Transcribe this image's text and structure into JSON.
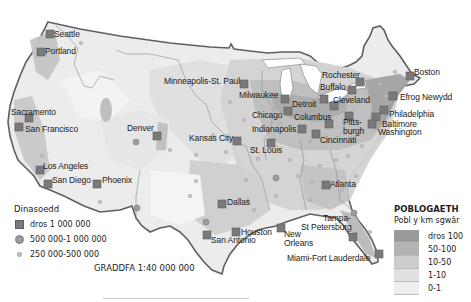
{
  "map": {
    "subject": "Population density of the contiguous United States",
    "colors": {
      "water": "#ffffff",
      "border": "#5f5f5f",
      "state_lines": "#8c8c8c",
      "city_large": "#7a7a7a",
      "city_medium": "#9c9c9c",
      "city_small": "#c8c8c8"
    },
    "cities": [
      {
        "name": "Seattle",
        "size": "large",
        "x": 50,
        "y": 34
      },
      {
        "name": "Portland",
        "size": "large",
        "x": 41,
        "y": 52
      },
      {
        "name": "Sacramento",
        "size": "large",
        "x": 28,
        "y": 118
      },
      {
        "name": "San Francisco",
        "size": "large",
        "x": 19,
        "y": 127
      },
      {
        "name": "Los Angeles",
        "size": "large",
        "x": 40,
        "y": 170
      },
      {
        "name": "San Diego",
        "size": "large",
        "x": 48,
        "y": 184
      },
      {
        "name": "Phoenix",
        "size": "large",
        "x": 97,
        "y": 184
      },
      {
        "name": "Denver",
        "size": "large",
        "x": 157,
        "y": 136
      },
      {
        "name": "Minneapolis-St. Paul",
        "size": "large",
        "x": 244,
        "y": 84
      },
      {
        "name": "Milwaukee",
        "size": "large",
        "x": 284,
        "y": 99
      },
      {
        "name": "Chicago",
        "size": "large",
        "x": 287,
        "y": 111
      },
      {
        "name": "Detroit",
        "size": "large",
        "x": 321,
        "y": 99
      },
      {
        "name": "Columbus",
        "size": "large",
        "x": 329,
        "y": 124
      },
      {
        "name": "Indianapolis",
        "size": "large",
        "x": 302,
        "y": 129
      },
      {
        "name": "Cincinnati",
        "size": "large",
        "x": 316,
        "y": 134
      },
      {
        "name": "Kansas City",
        "size": "large",
        "x": 237,
        "y": 141
      },
      {
        "name": "St. Louis",
        "size": "large",
        "x": 271,
        "y": 143
      },
      {
        "name": "Rochester",
        "size": "large",
        "x": 360,
        "y": 82
      },
      {
        "name": "Buffalo",
        "size": "large",
        "x": 352,
        "y": 90
      },
      {
        "name": "Cleveland",
        "size": "large",
        "x": 334,
        "y": 106
      },
      {
        "name": "Pittsburgh",
        "size": "large",
        "x": 349,
        "y": 116
      },
      {
        "name": "Boston",
        "size": "large",
        "x": 410,
        "y": 76
      },
      {
        "name": "Efrog Newydd",
        "size": "large",
        "x": 393,
        "y": 96
      },
      {
        "name": "Philadelphia",
        "size": "large",
        "x": 384,
        "y": 110
      },
      {
        "name": "Baltimore",
        "size": "large",
        "x": 376,
        "y": 117
      },
      {
        "name": "Washington",
        "size": "large",
        "x": 372,
        "y": 124
      },
      {
        "name": "Atlanta",
        "size": "large",
        "x": 326,
        "y": 185
      },
      {
        "name": "Dallas",
        "size": "large",
        "x": 222,
        "y": 204
      },
      {
        "name": "Houston",
        "size": "large",
        "x": 236,
        "y": 232
      },
      {
        "name": "San Antonio",
        "size": "large",
        "x": 207,
        "y": 235
      },
      {
        "name": "New Orleans",
        "size": "large",
        "x": 281,
        "y": 228
      },
      {
        "name": "Tampa-St Petersburg",
        "size": "large",
        "x": 353,
        "y": 237
      },
      {
        "name": "Miami-Fort Lauderdale",
        "size": "large",
        "x": 376,
        "y": 254
      }
    ]
  },
  "labels": [
    {
      "text": "Seattle",
      "x": 54,
      "y": 30
    },
    {
      "text": "Portland",
      "x": 45,
      "y": 47
    },
    {
      "text": "Sacramento",
      "x": 11,
      "y": 108
    },
    {
      "text": "San Francisco",
      "x": 25,
      "y": 125
    },
    {
      "text": "Los Angeles",
      "x": 43,
      "y": 162
    },
    {
      "text": "San Diego",
      "x": 52,
      "y": 176
    },
    {
      "text": "Phoenix",
      "x": 102,
      "y": 176
    },
    {
      "text": "Denver",
      "x": 127,
      "y": 124
    },
    {
      "text": "Minneapolis-St. Paul",
      "x": 164,
      "y": 77
    },
    {
      "text": "Milwaukee",
      "x": 239,
      "y": 91
    },
    {
      "text": "Chicago",
      "x": 252,
      "y": 111
    },
    {
      "text": "Detroit",
      "x": 292,
      "y": 100
    },
    {
      "text": "Columbus",
      "x": 294,
      "y": 113
    },
    {
      "text": "Indianapolis",
      "x": 252,
      "y": 125
    },
    {
      "text": "Cincinnati",
      "x": 320,
      "y": 136
    },
    {
      "text": "Kansas City",
      "x": 189,
      "y": 134
    },
    {
      "text": "St. Louis",
      "x": 250,
      "y": 146
    },
    {
      "text": "Rochester",
      "x": 322,
      "y": 71
    },
    {
      "text": "Buffalo",
      "x": 320,
      "y": 83
    },
    {
      "text": "Cleveland",
      "x": 333,
      "y": 96
    },
    {
      "text": "Pitts-",
      "x": 343,
      "y": 118
    },
    {
      "text": "burgh",
      "x": 343,
      "y": 127
    },
    {
      "text": "Boston",
      "x": 414,
      "y": 68
    },
    {
      "text": "Efrog Newydd",
      "x": 400,
      "y": 93
    },
    {
      "text": "Philadelphia",
      "x": 389,
      "y": 110
    },
    {
      "text": "Baltimore",
      "x": 382,
      "y": 120
    },
    {
      "text": "Washington",
      "x": 378,
      "y": 128
    },
    {
      "text": "Atlanta",
      "x": 330,
      "y": 180
    },
    {
      "text": "Dallas",
      "x": 227,
      "y": 198
    },
    {
      "text": "Houston",
      "x": 241,
      "y": 228
    },
    {
      "text": "San Antonio",
      "x": 211,
      "y": 236
    },
    {
      "text": "New",
      "x": 284,
      "y": 230
    },
    {
      "text": "Orleans",
      "x": 284,
      "y": 239
    },
    {
      "text": "Tampa-",
      "x": 323,
      "y": 214
    },
    {
      "text": "St Petersburg",
      "x": 301,
      "y": 223
    },
    {
      "text": "Miami-Fort Lauderdale",
      "x": 287,
      "y": 254
    }
  ],
  "legend_cities": {
    "title": "Dinasoedd",
    "items": [
      {
        "symbol": "square",
        "label": "dros 1 000 000"
      },
      {
        "symbol": "circle-medium",
        "label": "500 000-1 000 000"
      },
      {
        "symbol": "circle-small",
        "label": "250 000-500 000"
      }
    ]
  },
  "scale": {
    "text": "GRADDFA 1:40 000 000"
  },
  "legend_population": {
    "title": "POBLOGAETH",
    "subtitle": "Pobl y km sgwâr",
    "items": [
      {
        "label": "dros 100",
        "color": "#9a9a9a"
      },
      {
        "label": "50-100",
        "color": "#b3b3b3"
      },
      {
        "label": "10-50",
        "color": "#cdcdcd"
      },
      {
        "label": "1-10",
        "color": "#e0e0e0"
      },
      {
        "label": "0-1",
        "color": "#efefef"
      }
    ]
  }
}
